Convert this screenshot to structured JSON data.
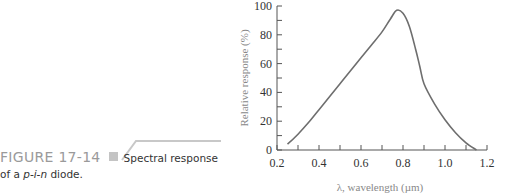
{
  "figure": {
    "number": "FIGURE 17-14",
    "title": "Spectral response",
    "subtitle_prefix": "of a ",
    "subtitle_italic": "p-i-n",
    "subtitle_suffix": " diode."
  },
  "chart_data": {
    "type": "line",
    "xlabel": "λ, wavelength (µm)",
    "ylabel": "Relative response (%)",
    "xlim": [
      0.2,
      1.2
    ],
    "ylim": [
      0,
      100
    ],
    "xticks": [
      0.2,
      0.4,
      0.6,
      0.8,
      1.0,
      1.2
    ],
    "xtick_labels": [
      "0.2",
      "0.4",
      "0.6",
      "0.8",
      "1.0",
      "1.2"
    ],
    "xminor_step": 0.1,
    "yticks": [
      0,
      20,
      40,
      60,
      80,
      100
    ],
    "ytick_labels": [
      "0",
      "20",
      "40",
      "60",
      "80",
      "100"
    ],
    "yminor_step": 10,
    "grid": false,
    "legend": null,
    "series": [
      {
        "name": "Relative response",
        "color": "#6e6e6e",
        "x": [
          0.25,
          0.3,
          0.35,
          0.4,
          0.45,
          0.5,
          0.55,
          0.6,
          0.65,
          0.7,
          0.74,
          0.77,
          0.8,
          0.83,
          0.86,
          0.88,
          0.9,
          0.95,
          1.0,
          1.05,
          1.1,
          1.15
        ],
        "y": [
          4,
          11,
          19,
          28,
          37,
          46,
          55,
          64,
          73,
          82,
          91,
          97,
          95,
          86,
          70,
          58,
          46,
          32,
          21,
          12,
          5,
          0
        ]
      }
    ]
  }
}
